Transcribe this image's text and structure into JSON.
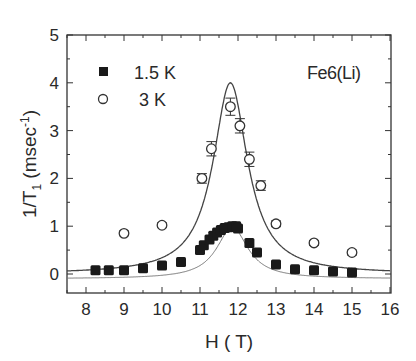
{
  "chart_data": {
    "type": "scatter",
    "title": "",
    "annotation": "Fe6(Li)",
    "xlabel": "H ( T)",
    "ylabel": "1/T1 (msec-1)",
    "ylabel_parts": {
      "main": "1/T",
      "sub": "1",
      "unit_open": " (msec",
      "sup": "-1",
      "unit_close": ")"
    },
    "xlim": [
      7.5,
      16
    ],
    "ylim": [
      -0.4,
      5
    ],
    "x_ticks": [
      8,
      9,
      10,
      11,
      12,
      13,
      14,
      15,
      16
    ],
    "y_ticks": [
      0,
      1,
      2,
      3,
      4,
      5
    ],
    "grid": false,
    "legend_position": "upper left",
    "series": [
      {
        "name": "1.5 K",
        "marker": "filled-square",
        "x": [
          8.25,
          8.6,
          9.0,
          9.5,
          10.0,
          10.5,
          11.0,
          11.1,
          11.25,
          11.35,
          11.45,
          11.55,
          11.65,
          11.75,
          11.85,
          11.95,
          12.0,
          12.3,
          12.5,
          13.0,
          13.5,
          14.0,
          14.5,
          15.0
        ],
        "y": [
          0.08,
          0.08,
          0.08,
          0.12,
          0.18,
          0.25,
          0.5,
          0.6,
          0.72,
          0.8,
          0.87,
          0.92,
          0.96,
          0.98,
          1.0,
          1.0,
          0.95,
          0.65,
          0.45,
          0.2,
          0.1,
          0.08,
          0.05,
          0.03
        ]
      },
      {
        "name": "3 K",
        "marker": "open-circle",
        "x": [
          9.0,
          10.0,
          11.05,
          11.3,
          11.8,
          12.05,
          12.3,
          12.6,
          13.0,
          14.0,
          15.0
        ],
        "y": [
          0.85,
          1.02,
          2.0,
          2.62,
          3.5,
          3.1,
          2.4,
          1.85,
          1.05,
          0.65,
          0.45
        ],
        "yerr": [
          0.05,
          0.05,
          0.1,
          0.15,
          0.18,
          0.15,
          0.15,
          0.1,
          0.06,
          0.05,
          0.05
        ]
      }
    ],
    "fits": [
      {
        "name": "fit-3K",
        "type": "lorentzian",
        "center": 11.8,
        "peak": 4.0,
        "width_hwhm": 0.55,
        "baseline": 0.0
      },
      {
        "name": "fit-1.5K",
        "type": "lorentzian",
        "center": 11.85,
        "peak": 0.98,
        "width_hwhm": 0.5,
        "baseline": -0.1
      }
    ]
  }
}
